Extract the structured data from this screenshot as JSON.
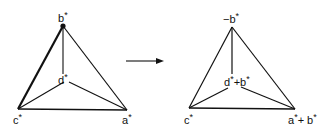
{
  "left_diagram": {
    "labels": {
      "top": "b",
      "center": "d",
      "left": "c",
      "right": "a"
    },
    "star": "*"
  },
  "arrow": {
    "direction": "right"
  },
  "right_diagram": {
    "labels": {
      "top_prefix": "−b",
      "center_a": "d",
      "center_plus": "+b",
      "left": "c",
      "right_a": "a",
      "right_plus": "+ b"
    },
    "star": "*"
  }
}
